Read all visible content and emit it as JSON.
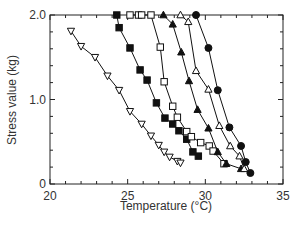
{
  "chart_data": {
    "type": "line",
    "title": "",
    "xlabel": "Temperature (°C)",
    "ylabel": "Stress value (kg)",
    "xlim": [
      20,
      35
    ],
    "ylim": [
      0,
      2.0
    ],
    "x_ticks": [
      20,
      25,
      30,
      35
    ],
    "x_tick_labels": [
      "20",
      "25",
      "30",
      "35"
    ],
    "x_minor_step": 1,
    "y_ticks": [
      0,
      1.0,
      2.0
    ],
    "y_tick_labels": [
      "0",
      "1.0",
      "2.0"
    ],
    "y_minor_step": 0.2,
    "grid": false,
    "legend": null,
    "series": [
      {
        "name": "open-down-triangle",
        "marker": "triangle-down-open",
        "x": [
          21.35,
          22.0,
          22.9,
          23.7,
          24.45,
          25.15,
          25.9,
          26.5,
          27.0,
          27.35,
          27.7,
          28.2,
          28.4
        ],
        "y": [
          1.81,
          1.63,
          1.5,
          1.28,
          1.11,
          0.86,
          0.71,
          0.57,
          0.46,
          0.38,
          0.32,
          0.27,
          0.25
        ]
      },
      {
        "name": "filled-square",
        "marker": "square-filled",
        "x": [
          24.3,
          24.45,
          25.15,
          25.8,
          26.25,
          26.85,
          27.4,
          27.9,
          28.3,
          28.8,
          29.2,
          29.55
        ],
        "y": [
          2.0,
          1.85,
          1.61,
          1.35,
          1.23,
          0.96,
          0.78,
          0.71,
          0.63,
          0.53,
          0.38,
          0.33
        ]
      },
      {
        "name": "open-square",
        "marker": "square-open",
        "x": [
          25.15,
          25.7,
          25.9,
          26.5,
          27.1,
          27.35,
          27.9,
          28.2,
          28.8,
          29.1,
          29.7,
          30.25,
          30.5,
          31.2
        ],
        "y": [
          2.0,
          2.0,
          2.0,
          2.0,
          1.62,
          1.21,
          0.92,
          0.79,
          0.62,
          0.56,
          0.49,
          0.45,
          0.39,
          0.24
        ]
      },
      {
        "name": "filled-up-triangle",
        "marker": "triangle-up-filled",
        "x": [
          27.3,
          27.9,
          28.45,
          28.95,
          29.5,
          30.2,
          30.8,
          31.35,
          32.3
        ],
        "y": [
          2.0,
          1.89,
          1.56,
          1.22,
          0.88,
          0.66,
          0.38,
          0.24,
          0.18
        ]
      },
      {
        "name": "open-up-triangle",
        "marker": "triangle-up-open",
        "x": [
          28.4,
          28.9,
          29.4,
          30.2,
          30.9,
          31.6,
          32.2,
          32.5
        ],
        "y": [
          2.0,
          1.92,
          1.34,
          1.12,
          0.69,
          0.45,
          0.33,
          0.18
        ]
      },
      {
        "name": "filled-circle",
        "marker": "circle-filled",
        "x": [
          29.4,
          30.2,
          30.8,
          31.55,
          32.3,
          32.6,
          32.9
        ],
        "y": [
          2.0,
          1.61,
          1.11,
          0.67,
          0.45,
          0.26,
          0.13
        ]
      }
    ]
  },
  "colors": {
    "axis": "#222222",
    "series": "#111111",
    "text": "#333333",
    "background": "#ffffff"
  }
}
